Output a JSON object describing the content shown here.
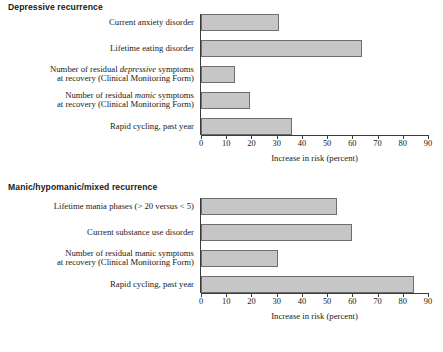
{
  "chart_data": [
    {
      "type": "bar",
      "orientation": "horizontal",
      "title": "Depressive recurrence",
      "xlabel": "Increase in risk (percent)",
      "ylabel": "",
      "xlim": [
        0,
        90
      ],
      "xticks": [
        0,
        10,
        20,
        30,
        40,
        50,
        60,
        70,
        80,
        90
      ],
      "grid": false,
      "legend": null,
      "categories": [
        "Current anxiety disorder",
        "Lifetime eating disorder",
        "Number of residual depressive symptoms at recovery (Clinical Monitoring Form)",
        "Number of residual manic symptoms at recovery (Clinical Monitoring Form)",
        "Rapid cycling, past year"
      ],
      "values": [
        31,
        64,
        13.5,
        19.5,
        36
      ],
      "bar_color": "#c6c6c6",
      "bar_edge_color": "#6e6e6e"
    },
    {
      "type": "bar",
      "orientation": "horizontal",
      "title": "Manic/hypomanic/mixed recurrence",
      "xlabel": "Increase in risk (percent)",
      "ylabel": "",
      "xlim": [
        0,
        90
      ],
      "xticks": [
        0,
        10,
        20,
        30,
        40,
        50,
        60,
        70,
        80,
        90
      ],
      "grid": false,
      "legend": null,
      "categories": [
        "Lifetime mania phases (> 20 versus < 5)",
        "Current substance use disorder",
        "Number of residual manic symptoms at recovery (Clinical Monitoring Form)",
        "Rapid cycling, past year"
      ],
      "values": [
        54,
        60,
        30.5,
        84.5
      ],
      "bar_color": "#c6c6c6",
      "bar_edge_color": "#6e6e6e"
    }
  ],
  "panels": {
    "top": {
      "title": "Depressive recurrence",
      "axis_title": "Increase in risk (percent)",
      "ticks": [
        "0",
        "10",
        "20",
        "30",
        "40",
        "50",
        "60",
        "70",
        "80",
        "90"
      ],
      "rows": [
        {
          "line1": "Current anxiety disorder",
          "line2": "",
          "value": 31
        },
        {
          "line1": "Lifetime eating disorder",
          "line2": "",
          "value": 64
        },
        {
          "line1_pre": "Number of residual ",
          "line1_em": "depressive",
          "line1_post": " symptoms",
          "line2": "at recovery (Clinical Monitoring Form)",
          "value": 13.5
        },
        {
          "line1_pre": "Number of residual ",
          "line1_em": "manic",
          "line1_post": " symptoms",
          "line2": "at recovery (Clinical Monitoring Form)",
          "value": 19.5
        },
        {
          "line1": "Rapid cycling, past year",
          "line2": "",
          "value": 36
        }
      ]
    },
    "bottom": {
      "title": "Manic/hypomanic/mixed recurrence",
      "axis_title": "Increase in risk (percent)",
      "ticks": [
        "0",
        "10",
        "20",
        "30",
        "40",
        "50",
        "60",
        "70",
        "80",
        "90"
      ],
      "rows": [
        {
          "line1": "Lifetime mania phases (> 20 versus < 5)",
          "line2": "",
          "value": 54
        },
        {
          "line1": "Current substance use disorder",
          "line2": "",
          "value": 60
        },
        {
          "line1": "Number of residual manic symptoms",
          "line2": "at recovery (Clinical Monitoring Form)",
          "value": 30.5
        },
        {
          "line1": "Rapid cycling, past year",
          "line2": "",
          "value": 84.5
        }
      ]
    }
  }
}
